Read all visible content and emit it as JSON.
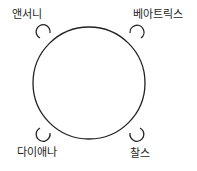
{
  "diagram": {
    "type": "seating-around-round-table",
    "table": {
      "shape": "circle",
      "cx": 89,
      "cy": 83,
      "r": 56
    },
    "seats": [
      {
        "position": "top-left",
        "name": "앤서니"
      },
      {
        "position": "top-right",
        "name": "베아트릭스"
      },
      {
        "position": "bottom-left",
        "name": "다이애나"
      },
      {
        "position": "bottom-right",
        "name": "찰스"
      }
    ]
  }
}
